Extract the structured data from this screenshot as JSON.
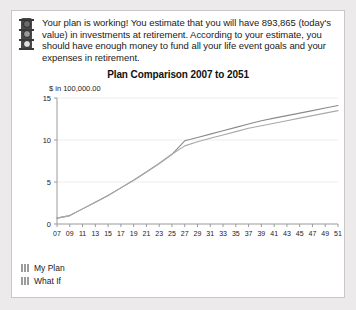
{
  "banner": {
    "icon": "traffic-light-icon",
    "message": "Your plan is working! You estimate that you will have 893,865 (today's value) in investments at retirement. According to your estimate, you should have enough money to fund all your life event goals and your expenses in retirement."
  },
  "legend": {
    "items": [
      {
        "label": "My Plan",
        "color": "#8b8b8b"
      },
      {
        "label": "What If",
        "color": "#a9a9a9"
      }
    ]
  },
  "chart_data": {
    "type": "line",
    "title": "Plan Comparison 2007 to 2051",
    "xlabel": "",
    "ylabel": "$ in 100,000.00",
    "ylim": [
      0,
      15
    ],
    "yticks": [
      0,
      5,
      10,
      15
    ],
    "ytick_labels": [
      "0",
      "5",
      "10",
      "15"
    ],
    "grid": true,
    "legend_position": "bottom-left",
    "x": [
      7,
      9,
      11,
      13,
      15,
      17,
      19,
      21,
      23,
      25,
      27,
      29,
      31,
      33,
      35,
      37,
      39,
      41,
      43,
      45,
      47,
      49,
      51
    ],
    "xtick_labels": [
      "07",
      "09",
      "11",
      "13",
      "15",
      "17",
      "19",
      "21",
      "23",
      "25",
      "27",
      "29",
      "31",
      "33",
      "35",
      "37",
      "39",
      "41",
      "43",
      "45",
      "47",
      "49",
      "51"
    ],
    "series": [
      {
        "name": "My Plan",
        "color": "#8b8b8b",
        "values": [
          0.7,
          1.0,
          1.8,
          2.6,
          3.4,
          4.3,
          5.2,
          6.2,
          7.2,
          8.3,
          9.9,
          10.3,
          10.7,
          11.1,
          11.5,
          11.9,
          12.3,
          12.6,
          12.9,
          13.2,
          13.5,
          13.8,
          14.1
        ]
      },
      {
        "name": "What If",
        "color": "#a9a9a9",
        "values": [
          0.7,
          1.0,
          1.8,
          2.6,
          3.4,
          4.3,
          5.2,
          6.2,
          7.2,
          8.3,
          9.3,
          9.8,
          10.2,
          10.6,
          11.0,
          11.4,
          11.7,
          12.0,
          12.3,
          12.6,
          12.9,
          13.2,
          13.5
        ]
      }
    ]
  }
}
